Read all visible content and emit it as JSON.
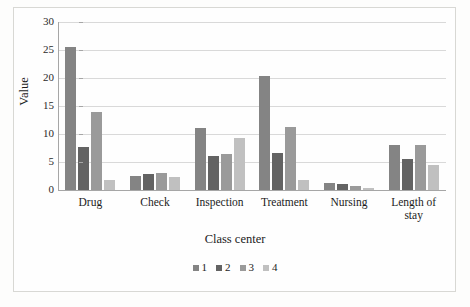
{
  "chart_data": {
    "type": "bar",
    "title": "",
    "xlabel": "Class center",
    "ylabel": "Value",
    "ylim": [
      0,
      30
    ],
    "yticks": [
      0,
      5,
      10,
      15,
      20,
      25,
      30
    ],
    "grid": true,
    "legend_position": "bottom",
    "categories": [
      "Drug",
      "Check",
      "Inspection",
      "Treatment",
      "Nursing",
      "Length of stay"
    ],
    "series": [
      {
        "name": "1",
        "color": "#848484",
        "values": [
          25.5,
          2.5,
          11.0,
          20.3,
          1.2,
          8.0
        ]
      },
      {
        "name": "2",
        "color": "#636363",
        "values": [
          7.7,
          2.8,
          6.0,
          6.6,
          1.0,
          5.6
        ]
      },
      {
        "name": "3",
        "color": "#9a9a9a",
        "values": [
          13.9,
          3.0,
          6.5,
          11.3,
          0.7,
          8.0
        ]
      },
      {
        "name": "4",
        "color": "#c0c0c0",
        "values": [
          1.8,
          2.3,
          9.3,
          1.8,
          0.4,
          4.5
        ]
      }
    ]
  },
  "axis": {
    "y_title": "Value",
    "x_title": "Class center",
    "tick_labels": [
      "30",
      "25",
      "20",
      "15",
      "10",
      "5",
      "0"
    ]
  },
  "category_labels": [
    {
      "line1": "Drug",
      "line2": ""
    },
    {
      "line1": "Check",
      "line2": ""
    },
    {
      "line1": "Inspection",
      "line2": ""
    },
    {
      "line1": "Treatment",
      "line2": ""
    },
    {
      "line1": "Nursing",
      "line2": ""
    },
    {
      "line1": "Length of",
      "line2": "stay"
    }
  ],
  "legend": {
    "items": [
      {
        "label": "1",
        "color": "#848484"
      },
      {
        "label": "2",
        "color": "#636363"
      },
      {
        "label": "3",
        "color": "#9a9a9a"
      },
      {
        "label": "4",
        "color": "#c0c0c0"
      }
    ]
  }
}
